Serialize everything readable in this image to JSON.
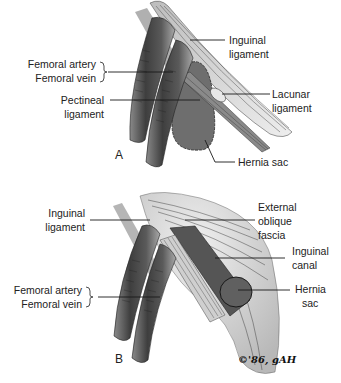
{
  "figure": {
    "panels": [
      {
        "letter": "A",
        "labels": {
          "femoral_artery": "Femoral artery",
          "femoral_vein": "Femoral vein",
          "pectineal_1": "Pectineal",
          "pectineal_2": "ligament",
          "inguinal_1": "Inguinal",
          "inguinal_2": "ligament",
          "lacunar_1": "Lacunar",
          "lacunar_2": "ligament",
          "hernia_sac": "Hernia sac"
        }
      },
      {
        "letter": "B",
        "labels": {
          "inguinal_1": "Inguinal",
          "inguinal_2": "ligament",
          "external_1": "External",
          "external_2": "oblique",
          "external_3": "fascia",
          "canal_1": "Inguinal",
          "canal_2": "canal",
          "hernia_1": "Hernia",
          "hernia_2": "sac",
          "femoral_artery": "Femoral artery",
          "femoral_vein": "Femoral vein"
        }
      }
    ],
    "signature": "©'86, gAH",
    "colors": {
      "vessel": "#4a4a4a",
      "vessel_light": "#9a9a9a",
      "hernia": "#6e6e6e",
      "ligament": "#cfcfcf",
      "line": "#1a1a1a"
    }
  }
}
